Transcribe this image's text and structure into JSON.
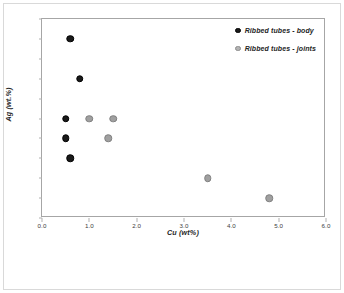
{
  "chart_data": {
    "type": "scatter",
    "title": "",
    "xlabel": "Cu (wt%)",
    "ylabel": "Ag (wt.%)",
    "xlim": [
      0.0,
      6.0
    ],
    "ylim": [
      6.4,
      7.4
    ],
    "xticks": [
      "0.0",
      "1.0",
      "2.0",
      "3.0",
      "4.0",
      "5.0",
      "6.0"
    ],
    "xtick_values": [
      0.0,
      1.0,
      2.0,
      3.0,
      4.0,
      5.0,
      6.0
    ],
    "yticks": [
      "6.4",
      "6.5",
      "6.6",
      "6.7",
      "6.8",
      "6.9",
      "7.0",
      "7.1",
      "7.2",
      "7.3",
      "7.4"
    ],
    "ytick_values": [
      6.4,
      6.5,
      6.6,
      6.7,
      6.8,
      6.9,
      7.0,
      7.1,
      7.2,
      7.3,
      7.4
    ],
    "grid": false,
    "legend_position": "top-right",
    "series": [
      {
        "name": "Ribbed tubes - body",
        "color": "#1a1a1a",
        "marker": "filled-circle",
        "points": [
          {
            "x": 0.6,
            "y": 7.3
          },
          {
            "x": 0.8,
            "y": 7.1
          },
          {
            "x": 0.5,
            "y": 6.9
          },
          {
            "x": 0.5,
            "y": 6.8
          },
          {
            "x": 0.6,
            "y": 6.7
          }
        ]
      },
      {
        "name": "Ribbed tubes - joints",
        "color": "#a0a0a0",
        "marker": "gray-circle",
        "points": [
          {
            "x": 1.0,
            "y": 6.9
          },
          {
            "x": 1.5,
            "y": 6.9
          },
          {
            "x": 1.4,
            "y": 6.8
          },
          {
            "x": 3.5,
            "y": 6.6
          },
          {
            "x": 4.8,
            "y": 6.5
          }
        ]
      }
    ]
  },
  "legend": {
    "items": [
      {
        "label": "Ribbed tubes - body"
      },
      {
        "label": "Ribbed tubes - joints"
      }
    ]
  }
}
